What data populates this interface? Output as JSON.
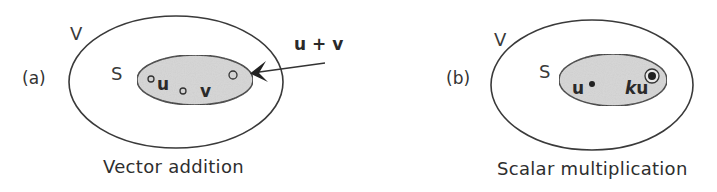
{
  "diagram": {
    "stroke_color": "#3a3a3a",
    "subspace_fill": "#d6d6d6",
    "panels": [
      {
        "id": "a",
        "panel_label": "(a)",
        "outer_set_label": "V",
        "inner_set_label": "S",
        "vectors": [
          {
            "label": "u",
            "marker": "open-circle"
          },
          {
            "label": "v",
            "marker": "open-circle"
          },
          {
            "label": "u + v",
            "marker": "open-circle",
            "arrow": true
          }
        ],
        "result_label": "u + v",
        "u_label": "u",
        "v_label": "v",
        "caption": "Vector addition"
      },
      {
        "id": "b",
        "panel_label": "(b)",
        "outer_set_label": "V",
        "inner_set_label": "S",
        "vectors": [
          {
            "label": "u",
            "marker": "filled-dot"
          },
          {
            "label": "ku",
            "marker": "target-circle"
          }
        ],
        "u_label": "u",
        "k_label": "k",
        "ku_u_label": "u",
        "caption": "Scalar multiplication"
      }
    ]
  }
}
